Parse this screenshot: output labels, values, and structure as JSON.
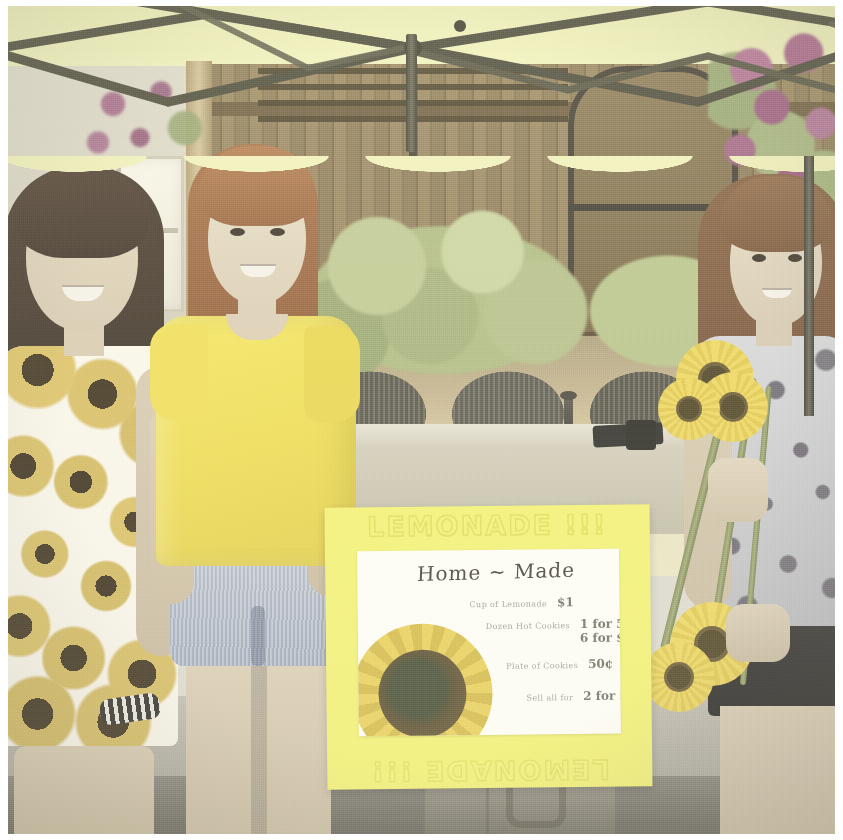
{
  "photo": {
    "scene_description": "Three girls standing beside an outdoor table under a yellow canopy at a homemade lemonade stand",
    "width": 843,
    "height": 840,
    "border_color": "#ffffff"
  },
  "sign": {
    "header_text": "LEMONADE !!!",
    "footer_text": "LEMONADE !!!",
    "poster_color": "#f3f142",
    "paper_color": "#fbfaf3",
    "title": "Home ~ Made",
    "menu": [
      {
        "item": "Cup of Lemonade",
        "price": "$1"
      },
      {
        "item": "Dozen Hot Cookies",
        "price": "1 for 50¢"
      },
      {
        "item": "",
        "price": "6 for $1"
      },
      {
        "item": "Plate of Cookies",
        "price": "50¢"
      },
      {
        "item": "Sell all for",
        "price": "2 for $1"
      }
    ],
    "artwork": "sunflower"
  },
  "canopy": {
    "fabric_color": "#edeea4",
    "frame_color": "#4e4b38",
    "type": "pop-up canopy tent"
  },
  "background": {
    "fence": "wood privacy fence",
    "fence_color": "#8e7346",
    "gate": "arched wooden gate",
    "bush_color": "#a8b96c",
    "flower_color": "#b35c8c",
    "flower_name": "crape myrtle",
    "mulch_color": "#c9b37d",
    "house_wall_color": "#ddd8c4"
  },
  "furniture": {
    "table_color": "#cfc9ae",
    "chairs": "wicker patio chairs",
    "chair_color": "#5f5c4b",
    "chair_count": 3
  },
  "girls": [
    {
      "position": "left",
      "hair": "long dark brown",
      "hair_color": "#3b2c20",
      "outfit": "white dress with sunflower print",
      "outfit_color": "#f6f1e2",
      "accessory": "beaded bracelet",
      "expression": "smiling"
    },
    {
      "position": "center",
      "hair": "red / auburn",
      "hair_color": "#b86a34",
      "outfit": "yellow t-shirt and denim shorts",
      "outfit_color": "#f4dc24",
      "accessory": "",
      "expression": "smiling"
    },
    {
      "position": "right",
      "hair": "long auburn",
      "hair_color": "#8d5a33",
      "outfit": "grey patterned top and black shorts",
      "outfit_color": "#c2c3ca",
      "accessory": "bouquet of sunflowers",
      "expression": "smiling"
    }
  ],
  "props": {
    "sunflowers_held": 3,
    "sunflower_petal_color": "#f0cd2b",
    "sunflower_center_color": "#4e3f18"
  }
}
